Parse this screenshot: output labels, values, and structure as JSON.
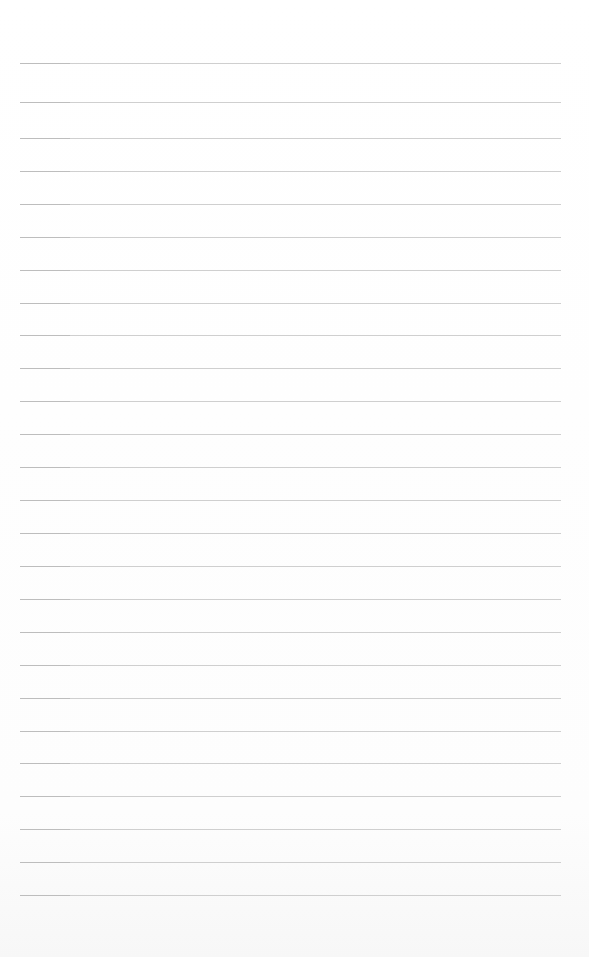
{
  "page": {
    "type": "lined-paper",
    "background_color": "#ffffff",
    "line_color": "#cfcfcf",
    "line_count": 26,
    "line_left": 20,
    "line_right": 561,
    "line_positions": [
      63,
      102,
      138,
      171,
      204,
      237,
      270,
      303,
      335,
      368,
      401,
      434,
      467,
      500,
      533,
      566,
      599,
      632,
      665,
      698,
      731,
      763,
      796,
      829,
      862,
      895
    ]
  }
}
